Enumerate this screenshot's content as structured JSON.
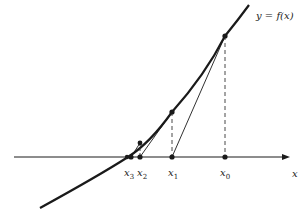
{
  "diagram": {
    "curve_label": "y = f(x)",
    "axis_label": "x",
    "iterates": [
      {
        "name": "x",
        "sub": "0"
      },
      {
        "name": "x",
        "sub": "1"
      },
      {
        "name": "x",
        "sub": "2"
      },
      {
        "name": "x",
        "sub": "3"
      }
    ],
    "colors": {
      "line": "#1a1a1a",
      "dashed": "#333333",
      "background": "#ffffff"
    }
  }
}
